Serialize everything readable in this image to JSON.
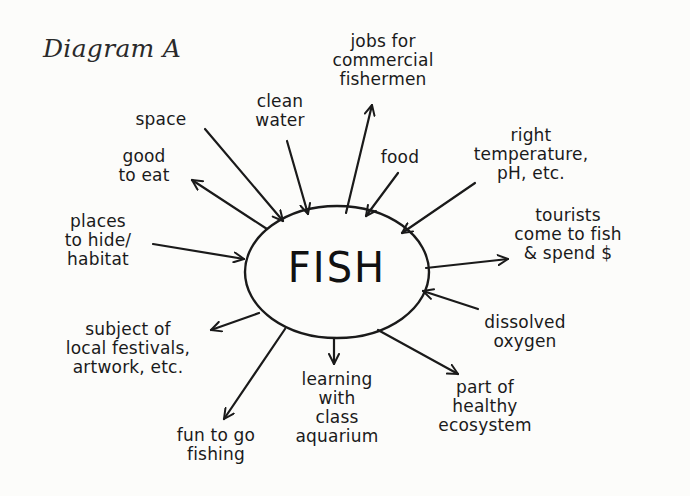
{
  "title": "Diagram A",
  "center": {
    "label": "FISH"
  },
  "colors": {
    "ink": "#1a1a1a",
    "background": "#fcfcfa"
  },
  "nodes": {
    "jobs": {
      "text": "jobs for\ncommercial\nfishermen",
      "direction": "outward"
    },
    "clean_water": {
      "text": "clean\nwater",
      "direction": "inward"
    },
    "space": {
      "text": "space",
      "direction": "inward"
    },
    "good_to_eat": {
      "text": "good\nto eat",
      "direction": "outward"
    },
    "food": {
      "text": "food",
      "direction": "inward"
    },
    "right_temperature": {
      "text": "right\ntemperature,\npH, etc.",
      "direction": "inward"
    },
    "places_to_hide": {
      "text": "places\nto hide/\nhabitat",
      "direction": "inward"
    },
    "tourists": {
      "text": "tourists\ncome to fish\n& spend $",
      "direction": "outward"
    },
    "dissolved_oxygen": {
      "text": "dissolved\noxygen",
      "direction": "inward"
    },
    "subject_of_festivals": {
      "text": "subject of\nlocal festivals,\nartwork, etc.",
      "direction": "outward"
    },
    "learning": {
      "text": "learning\nwith\nclass\naquarium",
      "direction": "outward"
    },
    "healthy_ecosystem": {
      "text": "part of\nhealthy\necosystem",
      "direction": "outward"
    },
    "fun_fishing": {
      "text": "fun to go\nfishing",
      "direction": "outward"
    }
  }
}
